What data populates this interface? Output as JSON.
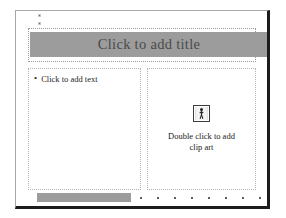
{
  "application": {
    "name": "slide-editor",
    "view": "slide-layout-editing"
  },
  "slide": {
    "title_placeholder": {
      "prompt": "Click to add title",
      "fill_color": "#9c9c9c",
      "text_color": "#4a4a4a",
      "border_style": "dotted"
    },
    "text_placeholder": {
      "bullet": "•",
      "prompt": "Click to add text",
      "border_style": "dotted"
    },
    "clipart_placeholder": {
      "icon_name": "clip-art-person-icon",
      "prompt_line_1": "Double click to add",
      "prompt_line_2": "clip art",
      "prompt": "Double click to add clip art",
      "border_style": "dotted"
    }
  },
  "guides": {
    "tick_marks": 2
  },
  "scrollbar": {
    "orientation": "horizontal",
    "thumb_color": "#9c9c9c",
    "tick_dots": 8
  },
  "colors": {
    "slide_background": "#ffffff",
    "frame_shadow": "#1c1c1c",
    "placeholder_border": "#b4b4b4",
    "title_band": "#9c9c9c"
  }
}
